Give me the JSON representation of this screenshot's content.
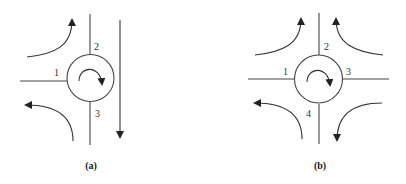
{
  "diagram": {
    "type": "roundabout-intersection-diagrams",
    "colors": {
      "line": "#444444",
      "background": "#ffffff"
    },
    "panels": [
      {
        "id": "a",
        "caption": "(a)",
        "description": "Three-leg roundabout (T-junction) with clockwise circulation",
        "legs": {
          "leg_1": "1",
          "leg_2": "2",
          "leg_3": "3"
        },
        "circulation": "clockwise",
        "flows": [
          "left-to-up turn",
          "down-to-left turn",
          "through southbound"
        ]
      },
      {
        "id": "b",
        "caption": "(b)",
        "description": "Four-leg roundabout with clockwise circulation",
        "legs": {
          "leg_1": "1",
          "leg_2": "2",
          "leg_3": "3",
          "leg_4": "4"
        },
        "circulation": "clockwise",
        "flows": [
          "left-to-up turn",
          "right-to-up turn",
          "down-to-left turn",
          "right-to-down turn"
        ]
      }
    ]
  }
}
